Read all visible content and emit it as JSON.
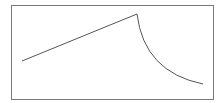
{
  "chart_data": {
    "type": "line",
    "title": "",
    "xlabel": "",
    "ylabel": "",
    "grid": false,
    "legend": null,
    "frame": {
      "left": 11,
      "top": 5,
      "right": 213,
      "bottom": 99,
      "color": "#7a7a7a"
    },
    "series": [
      {
        "name": "",
        "color": "#555555",
        "segments": [
          {
            "kind": "linear",
            "from": [
              22,
              61
            ],
            "to": [
              137,
              14
            ]
          },
          {
            "kind": "decay",
            "from": [
              137,
              14
            ],
            "to": [
              203,
              84
            ],
            "control": [
              144,
              72
            ]
          }
        ]
      }
    ]
  }
}
